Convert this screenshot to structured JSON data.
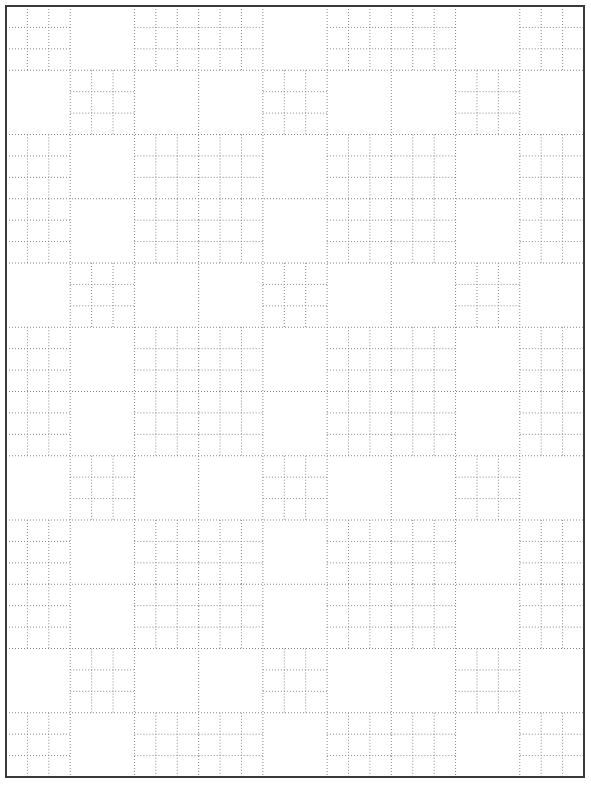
{
  "colors": {
    "background": "#ffffff",
    "frame": "#3a3a3a",
    "dotted_line": "#8a8a8a"
  },
  "frame": {
    "x": 6,
    "y": 6,
    "width": 578,
    "height": 771,
    "stroke_width": 2
  },
  "grid": {
    "block_columns": 9,
    "block_rows": 12,
    "subdivisions_per_block": 3,
    "row_types": {
      "A": {
        "subdivided_columns": [
          0,
          2,
          3,
          5,
          6,
          8
        ],
        "empty_columns": [
          1,
          4,
          7
        ]
      },
      "B": {
        "subdivided_columns": [
          1,
          4,
          7
        ],
        "empty_columns": [
          0,
          2,
          3,
          5,
          6,
          8
        ]
      }
    },
    "row_sequence": [
      "A",
      "B",
      "A",
      "A",
      "B",
      "A",
      "A",
      "B",
      "A",
      "A",
      "B",
      "A"
    ]
  }
}
